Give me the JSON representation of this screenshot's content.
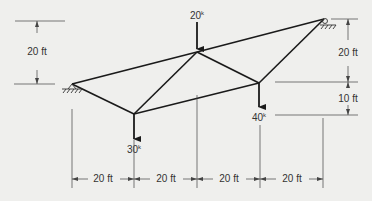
{
  "diagram": {
    "type": "truss",
    "colors": {
      "background": "#efefed",
      "member": "#1a1a1a",
      "dimension": "#444444",
      "text": "#333333"
    },
    "loads": [
      {
        "node": "top",
        "value": "20",
        "unit": "k"
      },
      {
        "node": "bottom-left",
        "value": "30",
        "unit": "k"
      },
      {
        "node": "bottom-right",
        "value": "40",
        "unit": "k"
      }
    ],
    "dimensions": {
      "left_vertical": "20 ft",
      "right_vertical_upper": "20 ft",
      "right_vertical_lower": "10 ft",
      "horizontal": [
        "20 ft",
        "20 ft",
        "20 ft",
        "20 ft"
      ]
    },
    "supports": [
      {
        "name": "left",
        "kind": "pin"
      },
      {
        "name": "right",
        "kind": "pin"
      }
    ]
  }
}
